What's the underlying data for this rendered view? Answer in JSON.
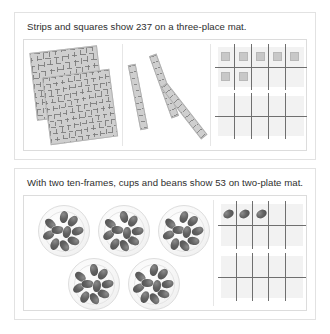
{
  "page": {
    "background": "#ffffff",
    "width": 330,
    "height": 334
  },
  "cards": [
    {
      "id": "three-place-mat",
      "caption": "Strips and squares show 237 on a three-place mat.",
      "number_shown": "237",
      "manipulative": "strips and squares",
      "mat_type": "three-place mat",
      "regions": [
        {
          "name": "hundreds",
          "label": "hundreds",
          "count": 2,
          "item": "hundred-square-flat",
          "value": 200
        },
        {
          "name": "tens",
          "label": "tens",
          "count": 3,
          "item": "ten-strip-rod",
          "value": 30
        },
        {
          "name": "ones",
          "label": "ones",
          "count": 7,
          "item": "unit-square",
          "value": 7
        }
      ],
      "ten_frames": [
        {
          "name": "upper-ten-frame",
          "filled": 7,
          "capacity": 10,
          "row_counts": [
            5,
            2
          ]
        },
        {
          "name": "lower-ten-frame",
          "filled": 0,
          "capacity": 10,
          "row_counts": [
            0,
            0
          ]
        }
      ]
    },
    {
      "id": "two-plate-mat",
      "caption": "With two ten-frames, cups and beans show 53 on two-plate mat.",
      "number_shown": "53",
      "manipulative": "cups and beans",
      "mat_type": "two-plate mat",
      "regions": [
        {
          "name": "tens",
          "label": "tens",
          "count": 5,
          "item": "cup-of-ten-beans",
          "value": 50
        },
        {
          "name": "ones",
          "label": "ones",
          "count": 3,
          "item": "loose-bean",
          "value": 3
        }
      ],
      "ten_frames": [
        {
          "name": "upper-ten-frame",
          "filled": 3,
          "capacity": 10,
          "row_counts": [
            3,
            0
          ]
        },
        {
          "name": "lower-ten-frame",
          "filled": 0,
          "capacity": 10,
          "row_counts": [
            0,
            0
          ]
        }
      ],
      "beans_per_cup": 10
    }
  ],
  "colors": {
    "card_border": "#e2e2e2",
    "panel_border": "#dcdcdc",
    "divider": "#e6e6e6",
    "block_fill": "#cfcfcf",
    "block_line": "#787878",
    "frame_line": "#6f6f6f",
    "frame_fill": "#f2f2f2",
    "bean_fill": "#636363",
    "text": "#2e2e2e"
  }
}
